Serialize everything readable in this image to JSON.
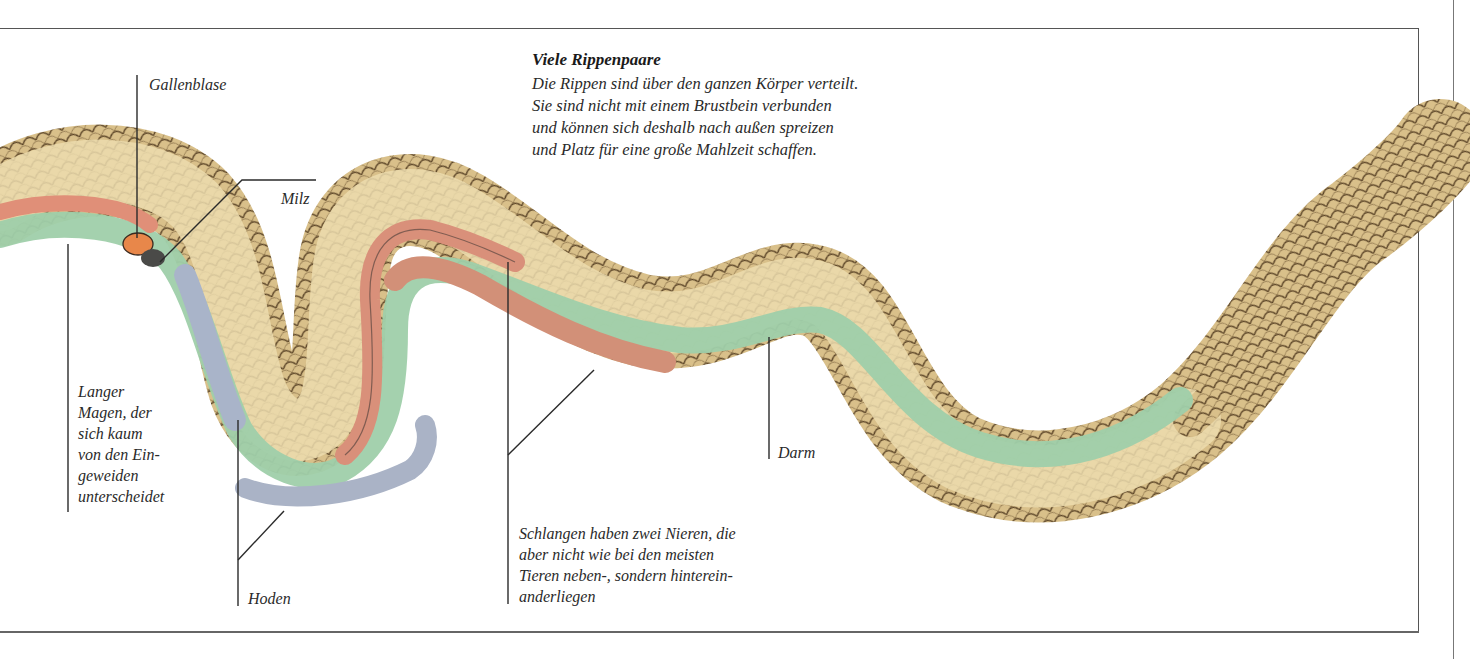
{
  "header": {
    "title": "Viele Rippenpaare",
    "description_lines": [
      "Die Rippen sind über den ganzen Körper verteilt.",
      "Sie sind nicht mit einem Brustbein verbunden",
      "und können sich deshalb nach außen spreizen",
      "und Platz für eine große Mahlzeit schaffen."
    ]
  },
  "labels": {
    "gallbladder": "Gallenblase",
    "spleen": "Milz",
    "stomach": [
      "Langer",
      "Magen, der",
      "sich kaum",
      "von den Ein-",
      "geweiden",
      "unterscheidet"
    ],
    "testes": "Hoden",
    "kidneys": [
      "Schlangen haben zwei Nieren, die",
      "aber nicht wie bei den meisten",
      "Tieren neben-, sondern hinterein-",
      "anderliegen"
    ],
    "intestine": "Darm"
  },
  "colors": {
    "skin": "#d9c08a",
    "skin_light": "#efe2b8",
    "scale_line": "#5a4326",
    "intestine_green": "#9fcfaa",
    "kidney_red": "#d9907a",
    "testes_blue": "#a9b4c9",
    "gallbladder_orange": "#e8874a",
    "spleen_dark": "#4a4a48",
    "label_line": "#2a2a2a"
  }
}
